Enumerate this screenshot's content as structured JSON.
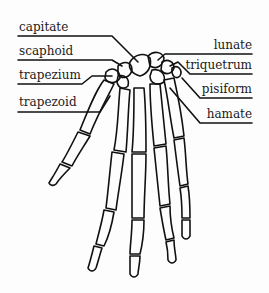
{
  "diagram": {
    "ink_color": "#111111",
    "background": "#fdfdfd",
    "labels_left": [
      {
        "text": "capitate"
      },
      {
        "text": "scaphoid"
      },
      {
        "text": "trapezium"
      },
      {
        "text": "trapezoid"
      }
    ],
    "labels_right": [
      {
        "text": "lunate"
      },
      {
        "text": "triquetrum"
      },
      {
        "text": "pisiform"
      },
      {
        "text": "hamate"
      }
    ]
  }
}
